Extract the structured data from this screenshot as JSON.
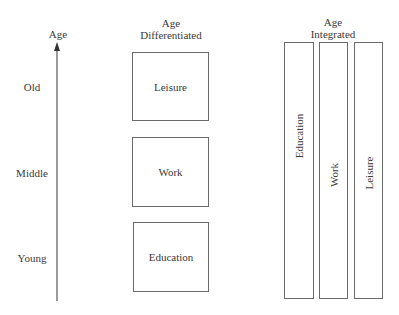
{
  "axis": {
    "title": "Age",
    "levels": [
      "Old",
      "Middle",
      "Young"
    ]
  },
  "differentiated": {
    "title_line1": "Age",
    "title_line2": "Differentiated",
    "boxes": [
      "Leisure",
      "Work",
      "Education"
    ]
  },
  "integrated": {
    "title_line1": "Age",
    "title_line2": "Integrated",
    "bars": [
      "Education",
      "Work",
      "Leisure"
    ]
  }
}
